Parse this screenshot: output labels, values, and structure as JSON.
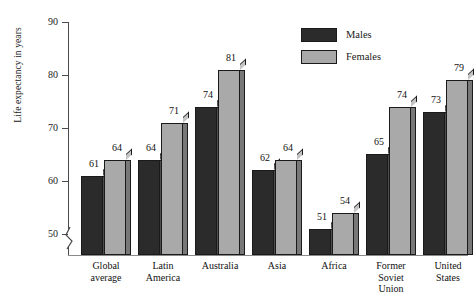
{
  "chart_data": {
    "type": "bar",
    "title": "",
    "xlabel": "",
    "ylabel": "Life expectancy in years",
    "ylim": [
      46,
      90
    ],
    "yticks": [
      50,
      60,
      70,
      80,
      90
    ],
    "axis_break": true,
    "grid": false,
    "legend_position": "top-right",
    "categories": [
      "Global average",
      "Latin America",
      "Australia",
      "Asia",
      "Africa",
      "Former Soviet Union",
      "United States"
    ],
    "category_lines": [
      [
        "Global",
        "average"
      ],
      [
        "Latin",
        "America"
      ],
      [
        "Australia"
      ],
      [
        "Asia"
      ],
      [
        "Africa"
      ],
      [
        "Former",
        "Soviet",
        "Union"
      ],
      [
        "United",
        "States"
      ]
    ],
    "series": [
      {
        "name": "Males",
        "color": "#2b2b2b",
        "values": [
          61,
          64,
          74,
          62,
          51,
          65,
          73
        ]
      },
      {
        "name": "Females",
        "color": "#a9a9a9",
        "values": [
          64,
          71,
          81,
          64,
          54,
          74,
          79
        ]
      }
    ]
  },
  "axis": {
    "y_title": "Life expectancy in years",
    "y_ticks": [
      "90",
      "80",
      "70",
      "60",
      "50"
    ]
  },
  "legend": {
    "items": [
      {
        "label": "Males"
      },
      {
        "label": "Females"
      }
    ]
  }
}
